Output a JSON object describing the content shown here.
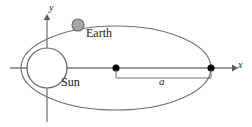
{
  "figure": {
    "labels": {
      "earth": "Earth",
      "sun": "Sun",
      "axis_x": "x",
      "axis_y": "y",
      "semimajor_axis": "a"
    },
    "colors": {
      "background": "#ffffff",
      "orbit_stroke": "#6e6e6e",
      "axis_stroke": "#7a7a7a",
      "sun_fill": "#ffffff",
      "sun_stroke": "#5a5a5a",
      "earth_fill": "#a8a8a8",
      "earth_stroke": "#6a6a6a",
      "focus_dot_fill": "#000000",
      "bracket_stroke": "#6e6e6e",
      "text": "#1a1a1a"
    },
    "geometry": {
      "orbit_center_x": 116,
      "orbit_center_y": 68,
      "orbit_radius_x": 95,
      "orbit_radius_y": 42,
      "sun_center_x": 47,
      "sun_center_y": 68,
      "sun_radius": 20,
      "earth_center_x": 78,
      "earth_center_y": 25,
      "earth_radius": 6,
      "focus_dot_x": 116,
      "focus_dot_y": 68,
      "vertex_dot_x": 211,
      "vertex_dot_y": 68,
      "dot_radius": 3.5,
      "x_axis_start_x": 10,
      "x_axis_end_x": 236,
      "x_axis_y": 68,
      "y_axis_x": 47,
      "y_axis_top_y": 14,
      "y_axis_bottom_y": 122,
      "bracket_left_x": 116,
      "bracket_right_x": 211,
      "bracket_y": 78,
      "bracket_tick_top_y": 70
    }
  }
}
